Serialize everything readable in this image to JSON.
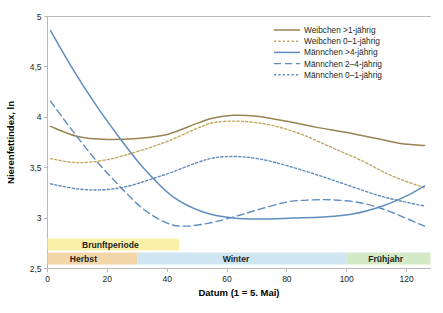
{
  "chart_data": {
    "type": "line",
    "title": "",
    "xlabel": "Datum (1 = 5. Mai)",
    "ylabel": "Nierenfettindex, ln",
    "xlim": [
      0,
      128
    ],
    "ylim": [
      2.5,
      5
    ],
    "grid": false,
    "legend_position": "top-right",
    "xticks": [
      "0",
      "20",
      "40",
      "60",
      "80",
      "100",
      "120"
    ],
    "xtick_values": [
      0,
      20,
      40,
      60,
      80,
      100,
      120
    ],
    "yticks": [
      "5",
      "4,5",
      "4",
      "3,5",
      "3",
      "2,5"
    ],
    "ytick_values": [
      5,
      4.5,
      4,
      3.5,
      3,
      2.5
    ],
    "series": [
      {
        "name": "Weibchen >1-jährig",
        "color": "#9a8352",
        "style": "solid",
        "x": [
          1,
          10,
          20,
          30,
          40,
          50,
          55,
          62,
          70,
          80,
          90,
          100,
          110,
          118,
          126
        ],
        "values": [
          3.91,
          3.81,
          3.78,
          3.79,
          3.83,
          3.94,
          3.99,
          4.02,
          4.01,
          3.96,
          3.9,
          3.85,
          3.79,
          3.74,
          3.72
        ]
      },
      {
        "name": "Weibchen 0–1-jährig",
        "color": "#c2a85f",
        "style": "dotted",
        "x": [
          1,
          10,
          20,
          30,
          40,
          50,
          56,
          65,
          75,
          85,
          95,
          105,
          115,
          126
        ],
        "values": [
          3.59,
          3.55,
          3.58,
          3.66,
          3.76,
          3.89,
          3.95,
          3.96,
          3.92,
          3.83,
          3.7,
          3.57,
          3.42,
          3.3
        ]
      },
      {
        "name": "Männchen >4-jährig",
        "color": "#5f8dbf",
        "style": "solid",
        "x": [
          1,
          8,
          16,
          24,
          32,
          42,
          52,
          62,
          72,
          82,
          92,
          102,
          112,
          120,
          126
        ],
        "values": [
          4.86,
          4.5,
          4.13,
          3.8,
          3.5,
          3.21,
          3.06,
          3.0,
          2.99,
          3.0,
          3.01,
          3.04,
          3.12,
          3.22,
          3.32
        ]
      },
      {
        "name": "Männchen 2–4-jährig",
        "color": "#5f8dbf",
        "style": "dashed",
        "x": [
          1,
          8,
          16,
          24,
          32,
          40,
          46,
          54,
          62,
          70,
          80,
          88,
          96,
          105,
          114,
          122,
          126
        ],
        "values": [
          4.16,
          3.88,
          3.58,
          3.32,
          3.09,
          2.95,
          2.92,
          2.95,
          3.01,
          3.08,
          3.16,
          3.18,
          3.18,
          3.15,
          3.07,
          2.97,
          2.92
        ]
      },
      {
        "name": "Männchen 0–1-jährig",
        "color": "#5f8dbf",
        "style": "dotted",
        "x": [
          1,
          10,
          18,
          26,
          34,
          42,
          50,
          56,
          64,
          72,
          80,
          90,
          100,
          110,
          118,
          126
        ],
        "values": [
          3.34,
          3.29,
          3.28,
          3.31,
          3.38,
          3.46,
          3.55,
          3.6,
          3.61,
          3.58,
          3.52,
          3.43,
          3.33,
          3.23,
          3.17,
          3.12
        ]
      }
    ],
    "bands": [
      {
        "label": "Brunftperiode",
        "color": "#fbf0a8",
        "x_start": 0,
        "x_end": 44,
        "row": 0,
        "label_x": 21
      },
      {
        "label": "Herbst",
        "color": "#f2d6aa",
        "x_start": 0,
        "x_end": 30,
        "row": 1,
        "label_x": 12
      },
      {
        "label": "Winter",
        "color": "#cfe5f1",
        "x_start": 30,
        "x_end": 100,
        "row": 1,
        "label_x": 63
      },
      {
        "label": "Frühjahr",
        "color": "#d4e9c6",
        "x_start": 100,
        "x_end": 128,
        "row": 1,
        "label_x": 113
      }
    ]
  }
}
